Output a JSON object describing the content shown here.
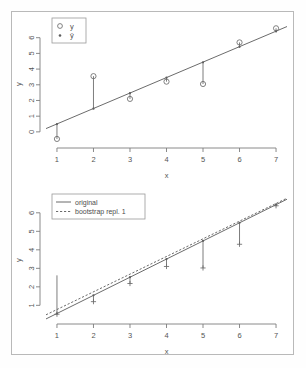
{
  "figure": {
    "background": "#ffffff",
    "frame_color": "#b9b9b9",
    "line_color": "#5a5a5a",
    "point_color": "#6b6b6b"
  },
  "chart_data": [
    {
      "id": "top",
      "type": "scatter",
      "title": "",
      "xlabel": "x",
      "ylabel": "y",
      "xlim": [
        0.7,
        7.3
      ],
      "ylim": [
        -0.9,
        7.0
      ],
      "xticks": [
        1,
        2,
        3,
        4,
        5,
        6,
        7
      ],
      "xtick_labels": [
        "1",
        "2",
        "3",
        "4",
        "5",
        "6",
        "7"
      ],
      "yticks": [
        0,
        1,
        2,
        3,
        4,
        5,
        6
      ],
      "ytick_labels": [
        "0",
        "1",
        "2",
        "3",
        "4",
        "5",
        "6"
      ],
      "grid": false,
      "legend_position": "top-left",
      "legend": [
        {
          "label": "y",
          "marker": "open-circle"
        },
        {
          "label": "ŷ",
          "marker": "dot"
        }
      ],
      "x": [
        1,
        2,
        3,
        4,
        5,
        6,
        7
      ],
      "series": [
        {
          "name": "y",
          "marker": "open-circle",
          "values": [
            -0.45,
            3.55,
            2.1,
            3.2,
            3.05,
            5.7,
            6.6
          ]
        },
        {
          "name": "ŷ",
          "marker": "dot",
          "values": [
            0.5,
            1.48,
            2.47,
            3.45,
            4.43,
            5.42,
            6.4
          ]
        }
      ],
      "fit_line": {
        "intercept": -0.48,
        "slope": 0.985,
        "style": "solid"
      },
      "residual_segments": true
    },
    {
      "id": "bottom",
      "type": "line",
      "title": "",
      "xlabel": "x",
      "ylabel": "y",
      "xlim": [
        0.7,
        7.3
      ],
      "ylim": [
        0.1,
        6.8
      ],
      "xticks": [
        1,
        2,
        3,
        4,
        5,
        6,
        7
      ],
      "xtick_labels": [
        "1",
        "2",
        "3",
        "4",
        "5",
        "6",
        "7"
      ],
      "yticks": [
        1,
        2,
        3,
        4,
        5,
        6
      ],
      "ytick_labels": [
        "1",
        "2",
        "3",
        "4",
        "5",
        "6"
      ],
      "grid": false,
      "legend_position": "top-left",
      "legend": [
        {
          "label": "original",
          "style": "solid"
        },
        {
          "label": "bootstrap repl. 1",
          "style": "dashed"
        }
      ],
      "x": [
        1,
        2,
        3,
        4,
        5,
        6,
        7
      ],
      "series": [
        {
          "name": "original",
          "style": "solid",
          "intercept": -0.42,
          "slope": 0.98,
          "values": [
            0.56,
            1.54,
            2.52,
            3.5,
            4.48,
            5.46,
            6.44
          ]
        },
        {
          "name": "bootstrap repl. 1",
          "style": "dashed",
          "intercept": -0.18,
          "slope": 0.955,
          "values": [
            0.78,
            1.73,
            2.69,
            3.64,
            4.6,
            5.55,
            6.5
          ]
        }
      ],
      "observed": {
        "marker": "cross",
        "values": [
          0.52,
          1.2,
          2.18,
          3.1,
          3.02,
          4.3,
          6.38
        ]
      },
      "fitted_points": {
        "marker": "dot",
        "values": [
          0.56,
          1.54,
          2.52,
          3.5,
          4.48,
          5.46,
          6.44
        ]
      },
      "whisker_tops": [
        2.62,
        1.5,
        2.5,
        3.45,
        4.42,
        5.4,
        6.45
      ]
    }
  ]
}
